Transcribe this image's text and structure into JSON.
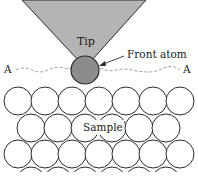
{
  "diagram": {
    "labels": {
      "tip": "Tip",
      "front_atom": "Front atom",
      "sample": "Sample",
      "line_left": "A",
      "line_right": "A"
    },
    "colors": {
      "tip_fill": "#b4b4b4",
      "front_atom_fill": "#8c8c8c",
      "stroke": "#2a2a2a",
      "path_dash": "#9a9a9a",
      "sample_fill": "#ffffff"
    },
    "tip": {
      "top_left": [
        22,
        0
      ],
      "top_right": [
        146,
        0
      ],
      "apex": [
        85,
        62
      ]
    },
    "front_atom": {
      "cx": 85,
      "cy": 70,
      "r": 14
    },
    "sample_atoms": {
      "radius": 14,
      "rows": [
        {
          "cy": 101,
          "cx": [
            18,
            45,
            72,
            99,
            126,
            153,
            180
          ]
        },
        {
          "cy": 128,
          "cx": [
            31,
            58,
            85,
            112,
            139,
            166
          ]
        },
        {
          "cy": 154,
          "cx": [
            18,
            45,
            72,
            99,
            126,
            153,
            180
          ]
        }
      ]
    }
  }
}
